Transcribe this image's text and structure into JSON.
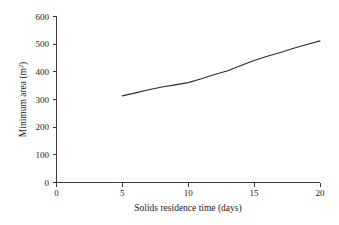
{
  "chart_data": {
    "type": "line",
    "title": "",
    "subtitle": "",
    "xlabel": "Solids residence time (days)",
    "ylabel_text": "Minimum area (m",
    "ylabel_sup": "2",
    "ylabel_tail": ")",
    "ylabel_full": "Minimum area (m2)",
    "xlim": [
      0,
      20
    ],
    "ylim": [
      0,
      600
    ],
    "xticks": [
      0,
      5,
      10,
      15,
      20
    ],
    "xtick_labels": [
      "0",
      "5",
      "10",
      "15",
      "20"
    ],
    "yticks": [
      0,
      100,
      200,
      300,
      400,
      500,
      600
    ],
    "ytick_labels": [
      "0",
      "100",
      "200",
      "300",
      "400",
      "500",
      "600"
    ],
    "grid": false,
    "legend": false,
    "legend_position": "none",
    "series": [
      {
        "name": "Minimum area",
        "color": "#2b2b2b",
        "x": [
          5,
          6,
          7,
          8,
          9,
          10,
          11,
          12,
          13,
          14,
          15,
          16,
          17,
          18,
          19,
          20
        ],
        "values": [
          313,
          324,
          335,
          345,
          353,
          361,
          375,
          390,
          404,
          423,
          441,
          456,
          470,
          485,
          499,
          512
        ]
      }
    ],
    "annotations": []
  },
  "style": {
    "background": "#ffffff",
    "axis_color": "#3a3a3a",
    "text_color": "#1a1a1a",
    "curve_color": "#2b2b2b"
  }
}
